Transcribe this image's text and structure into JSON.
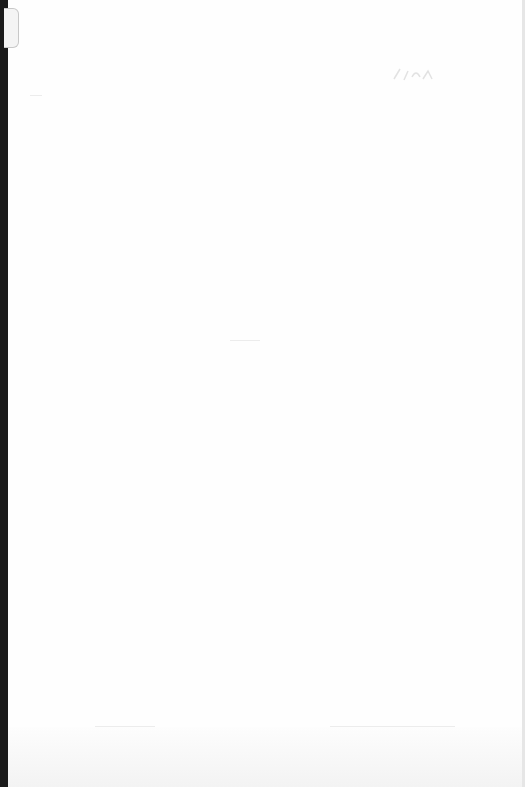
{
  "page": {
    "content": "",
    "annotation": "illegible faint handwritten mark",
    "colors": {
      "paper": "#fefefe",
      "background": "#1a1a1a"
    }
  }
}
